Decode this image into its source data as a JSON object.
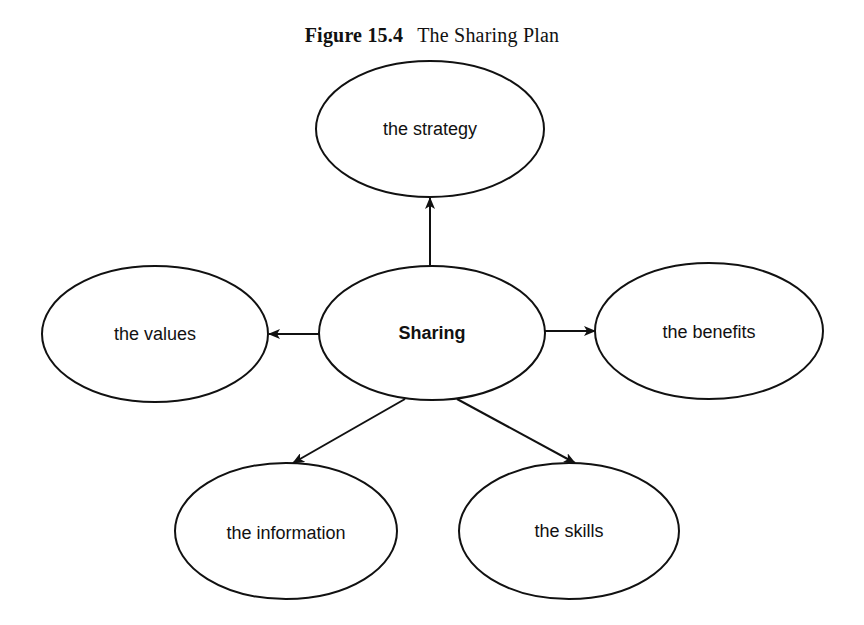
{
  "figure": {
    "number": "Figure 15.4",
    "title": "The Sharing Plan"
  },
  "diagram": {
    "central_node": {
      "id": "sharing",
      "label": "Sharing",
      "bold": true
    },
    "nodes": [
      {
        "id": "strategy",
        "label": "the strategy"
      },
      {
        "id": "values",
        "label": "the values"
      },
      {
        "id": "benefits",
        "label": "the benefits"
      },
      {
        "id": "information",
        "label": "the information"
      },
      {
        "id": "skills",
        "label": "the skills"
      }
    ],
    "edges": [
      {
        "from": "sharing",
        "to": "strategy",
        "directed": true
      },
      {
        "from": "sharing",
        "to": "values",
        "directed": true
      },
      {
        "from": "sharing",
        "to": "benefits",
        "directed": true
      },
      {
        "from": "sharing",
        "to": "information",
        "directed": true
      },
      {
        "from": "sharing",
        "to": "skills",
        "directed": true
      }
    ],
    "colors": {
      "stroke": "#111111",
      "fill": "#ffffff",
      "background": "#ffffff"
    }
  }
}
